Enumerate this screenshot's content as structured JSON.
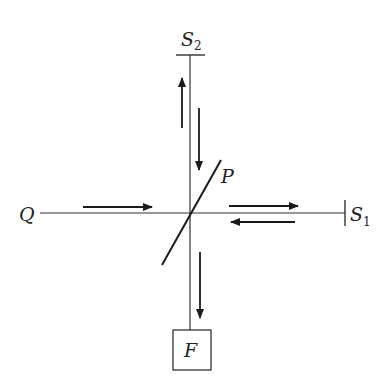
{
  "diagram": {
    "type": "interferometer-schematic",
    "labels": {
      "source": "Q",
      "plate": "P",
      "mirror1_main": "S",
      "mirror1_sub": "1",
      "mirror2_main": "S",
      "mirror2_sub": "2",
      "detector": "F"
    },
    "colors": {
      "line": "#333333",
      "arrow": "#1a1a1a",
      "background": "#ffffff"
    }
  }
}
